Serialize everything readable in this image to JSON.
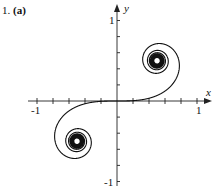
{
  "problem": {
    "number": "1.",
    "part": "(a)"
  },
  "chart_data": {
    "type": "line",
    "title": "",
    "xlabel": "x",
    "ylabel": "y",
    "xlim": [
      -1,
      1
    ],
    "ylim": [
      -1,
      1
    ],
    "x_ticks": [
      -1,
      -0.8,
      -0.6,
      -0.4,
      -0.2,
      0,
      0.2,
      0.4,
      0.6,
      0.8,
      1
    ],
    "y_ticks": [
      -1,
      -0.8,
      -0.6,
      -0.4,
      -0.2,
      0,
      0.2,
      0.4,
      0.6,
      0.8,
      1
    ],
    "x_tick_labels": [
      "-1",
      "1"
    ],
    "y_tick_labels": [
      "1",
      "-1"
    ],
    "grid": false,
    "legend": null,
    "parameter_range": [
      -8,
      8
    ],
    "limit_points": [
      [
        0.5,
        0.5
      ],
      [
        -0.5,
        -0.5
      ]
    ],
    "sample_points": [
      {
        "t": 0,
        "x": 0.0,
        "y": 0.0
      },
      {
        "t": 0.5,
        "x": 0.49,
        "y": 0.06
      },
      {
        "t": 1.0,
        "x": 0.78,
        "y": 0.44
      },
      {
        "t": 1.5,
        "x": 0.45,
        "y": 0.7
      },
      {
        "t": 2.0,
        "x": 0.49,
        "y": 0.34
      },
      {
        "t": -1.0,
        "x": -0.78,
        "y": -0.44
      },
      {
        "t": -1.5,
        "x": -0.45,
        "y": -0.7
      }
    ],
    "axes": {
      "x_label": "x",
      "y_label": "y",
      "x_min_label": "-1",
      "x_max_label": "1",
      "y_max_label": "1",
      "y_min_label": "-1"
    },
    "colors": {
      "curve": "#111111",
      "axes": "#222222"
    }
  }
}
